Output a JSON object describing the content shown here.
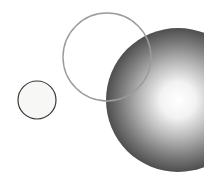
{
  "canvas": {
    "width": 204,
    "height": 184,
    "background_color": "#ffffff",
    "title": "Three overlapping circles"
  },
  "palette": {
    "background": "#ffffff",
    "small_circle_fill": "#f7f7f5",
    "small_circle_stroke": "#3b3b3b",
    "outline_circle_stroke": "#9b9b9b",
    "sphere_highlight": "#ffffff",
    "sphere_midtone": "#8a8a8a",
    "sphere_shadow": "#141414",
    "sphere_rim": "#0a0a0a"
  },
  "shapes": [
    {
      "id": "small-circle",
      "name": "small-outlined-circle",
      "kind": "circle",
      "cx": 37,
      "cy": 100,
      "r": 19,
      "fill": "#f7f7f5",
      "stroke": "#3b3b3b",
      "stroke_width": 1.2,
      "z": 1
    },
    {
      "id": "gradient-sphere",
      "name": "large-gradient-sphere",
      "kind": "circle",
      "cx": 178,
      "cy": 100,
      "r": 72,
      "fill": "radial-gradient",
      "stroke": "none",
      "stroke_width": 0,
      "z": 2,
      "gradient": {
        "type": "radial",
        "focus_x": 178,
        "focus_y": 100,
        "stops": [
          {
            "offset": 0.0,
            "color": "#ffffff"
          },
          {
            "offset": 0.18,
            "color": "#f2f2f2"
          },
          {
            "offset": 0.38,
            "color": "#b8b8b8"
          },
          {
            "offset": 0.58,
            "color": "#787878"
          },
          {
            "offset": 0.78,
            "color": "#3c3c3c"
          },
          {
            "offset": 0.92,
            "color": "#1c1c1c"
          },
          {
            "offset": 1.0,
            "color": "#0a0a0a"
          }
        ]
      }
    },
    {
      "id": "outline-circle",
      "name": "medium-unfilled-circle",
      "kind": "circle",
      "cx": 107,
      "cy": 57,
      "r": 44,
      "fill": "none",
      "stroke": "#9b9b9b",
      "stroke_width": 1.4,
      "z": 3
    }
  ],
  "chart_data": {
    "type": "scatter",
    "xlabel": "",
    "ylabel": "",
    "xlim": [
      0,
      204
    ],
    "ylim": [
      0,
      184
    ],
    "grid": false,
    "legend": "none",
    "series": [
      {
        "name": "small-outlined-circle",
        "x": [
          37
        ],
        "y": [
          100
        ],
        "radius": [
          19
        ],
        "fill": "#f7f7f5",
        "stroke": "#3b3b3b"
      },
      {
        "name": "medium-unfilled-circle",
        "x": [
          107
        ],
        "y": [
          57
        ],
        "radius": [
          44
        ],
        "fill": "none",
        "stroke": "#9b9b9b"
      },
      {
        "name": "large-gradient-sphere",
        "x": [
          178
        ],
        "y": [
          100
        ],
        "radius": [
          72
        ],
        "fill": "radial-gradient(#ffffff -> #0a0a0a)",
        "stroke": "none"
      }
    ],
    "annotations": []
  }
}
